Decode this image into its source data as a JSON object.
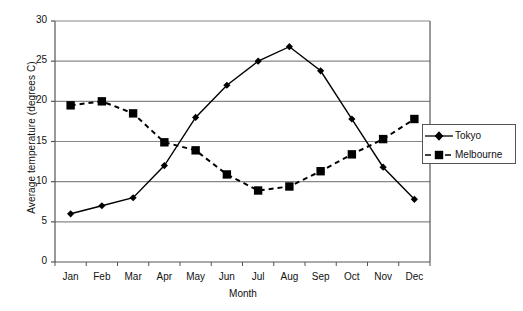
{
  "chart_data": {
    "type": "line",
    "title": "",
    "xlabel": "Month",
    "ylabel": "Average temperature (degrees C)",
    "categories": [
      "Jan",
      "Feb",
      "Mar",
      "Apr",
      "May",
      "Jun",
      "Jul",
      "Aug",
      "Sep",
      "Oct",
      "Nov",
      "Dec"
    ],
    "ylim": [
      0,
      30
    ],
    "yticks": [
      0,
      5,
      10,
      15,
      20,
      25,
      30
    ],
    "ytick_labels": [
      "0",
      "5",
      "10",
      "15",
      "20",
      "25",
      "30"
    ],
    "grid": "horizontal",
    "legend_position": "right-middle",
    "series": [
      {
        "name": "Tokyo",
        "marker": "diamond",
        "line_style": "solid",
        "color": "#000000",
        "values": [
          6,
          7,
          8,
          12,
          18,
          22,
          25,
          26.8,
          23.8,
          17.8,
          11.8,
          7.8
        ]
      },
      {
        "name": "Melbourne",
        "marker": "square",
        "line_style": "dashed",
        "color": "#000000",
        "values": [
          19.5,
          20,
          18.5,
          14.9,
          13.9,
          10.9,
          8.9,
          9.4,
          11.3,
          13.4,
          15.3,
          17.8
        ]
      }
    ]
  },
  "legend": {
    "items": [
      {
        "label": "Tokyo",
        "marker": "diamond-marker-icon",
        "line_style": "solid"
      },
      {
        "label": "Melbourne",
        "marker": "square-marker-icon",
        "line_style": "dashed"
      }
    ]
  },
  "axes": {
    "x_title": "Month",
    "y_title": "Average temperature (degrees C)"
  },
  "colors": {
    "plot_border": "#555555",
    "gridline": "#888888",
    "series": "#000000",
    "background": "#ffffff",
    "text": "#111111"
  }
}
